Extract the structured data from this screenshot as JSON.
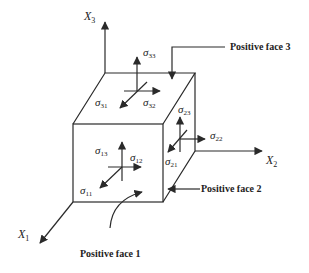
{
  "diagram": {
    "type": "stress-tensor-cube",
    "axes": [
      {
        "id": "x1",
        "symbol": "X",
        "index": "1"
      },
      {
        "id": "x2",
        "symbol": "X",
        "index": "2"
      },
      {
        "id": "x3",
        "symbol": "X",
        "index": "3"
      }
    ],
    "stress_components": {
      "face1": [
        {
          "symbol": "σ",
          "index": "11"
        },
        {
          "symbol": "σ",
          "index": "12"
        },
        {
          "symbol": "σ",
          "index": "13"
        }
      ],
      "face2": [
        {
          "symbol": "σ",
          "index": "21"
        },
        {
          "symbol": "σ",
          "index": "22"
        },
        {
          "symbol": "σ",
          "index": "23"
        }
      ],
      "face3": [
        {
          "symbol": "σ",
          "index": "31"
        },
        {
          "symbol": "σ",
          "index": "32"
        },
        {
          "symbol": "σ",
          "index": "33"
        }
      ]
    },
    "face_labels": {
      "face1": "Positive face 1",
      "face2": "Positive face 2",
      "face3": "Positive face 3"
    },
    "colors": {
      "line": "#2a2a2a",
      "background": "#ffffff"
    }
  }
}
